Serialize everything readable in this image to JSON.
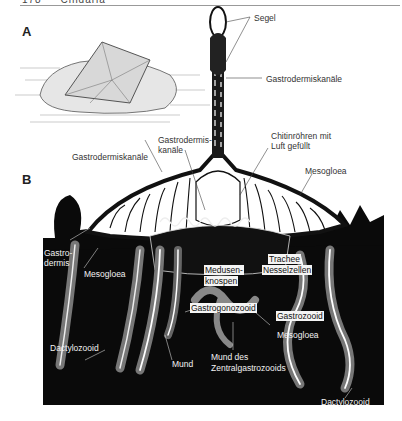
{
  "header": {
    "page_number": "178",
    "chapter": "Cnidaria"
  },
  "panels": {
    "A": {
      "letter": "A",
      "description": "Velella – habitus floating on water surface"
    },
    "B": {
      "letter": "B",
      "description": "Schematic longitudinal section"
    }
  },
  "labels": {
    "segel": "Segel",
    "gastrodermiskanaele_top": "Gastrodermiskanäle",
    "gastrodermis_kanaele_line1": "Gastrodermis-",
    "gastrodermis_kanaele_line2": "kanäle",
    "gastrodermiskanaele_left": "Gastrodermiskanäle",
    "chitinroehren_line1": "Chitinröhren mit",
    "chitinroehren_line2": "Luft gefüllt",
    "mesogloea_top": "Mesogloea",
    "gastrodermis_line1": "Gastro-",
    "gastrodermis_line2": "dermis",
    "mesogloea_left": "Mesogloea",
    "medusenknospen_line1": "Medusen-",
    "medusenknospen_line2": "knospen",
    "trachee": "Trachee",
    "nesselzellen": "Nesselzellen",
    "gastrogonozooid": "Gastrogonozooid",
    "gastrozooid": "Gastrozooid",
    "mesogloea_right": "Mesogloea",
    "dactylozooid_left": "Dactylozooid",
    "mund": "Mund",
    "mund_des_line1": "Mund des",
    "mund_des_line2": "Zentralgastrozooids",
    "dactylozooid_right": "Dactylozooid"
  },
  "colors": {
    "background": "#ffffff",
    "panel_dark": "#0a0a0a",
    "line": "#333333"
  }
}
